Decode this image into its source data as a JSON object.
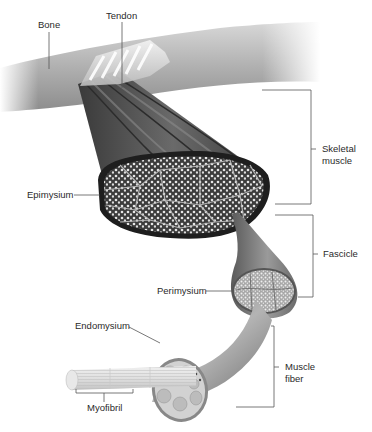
{
  "diagram": {
    "colors": {
      "background": "#ffffff",
      "leader_line": "#555555",
      "text": "#2a2a2a",
      "bone": "#a8a8a8",
      "muscle_dark": "#4a4a4a",
      "epimysium": "#1e1e1e",
      "fascicle": "#7a7a7a",
      "fiber": "#9a9a9a"
    },
    "labels": {
      "bone": "Bone",
      "tendon": "Tendon",
      "epimysium": "Epimysium",
      "perimysium": "Perimysium",
      "endomysium": "Endomysium",
      "myofibril": "Myofibril"
    },
    "brackets": [
      {
        "label": "Skeletal\nmuscle",
        "key": "skeletal_muscle"
      },
      {
        "label": "Fascicle",
        "key": "fascicle"
      },
      {
        "label": "Muscle\nfiber",
        "key": "muscle_fiber"
      }
    ]
  }
}
